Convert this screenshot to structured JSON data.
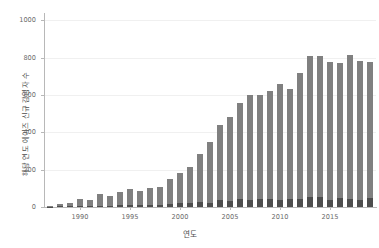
{
  "chart_data": {
    "type": "bar",
    "stacked": true,
    "title": "",
    "subtitle": "",
    "xlabel": "연도",
    "ylabel": "해당 연도 에이즈 신규 감염자 수",
    "xlim": [
      1986.4,
      2019.6
    ],
    "ylim": [
      0,
      1040
    ],
    "yticks": [
      0,
      200,
      400,
      600,
      800,
      1000
    ],
    "ytick_labels": [
      "0",
      "200",
      "400",
      "600",
      "800",
      "1000"
    ],
    "xticks": [
      1990,
      1995,
      2000,
      2005,
      2010,
      2015
    ],
    "xtick_labels": [
      "1990",
      "1995",
      "2000",
      "2005",
      "2010",
      "2015"
    ],
    "grid": true,
    "grid_axis": "y",
    "legend": null,
    "colors": {
      "segment_lower": "#4d4d4d",
      "segment_upper": "#808080",
      "axis": "#b8b8b8",
      "grid": "#f0f0f0",
      "text": "#4d4d4d",
      "tick_text": "#6b6b6b",
      "background": "#ffffff"
    },
    "categories": [
      "1987",
      "1988",
      "1989",
      "1990",
      "1991",
      "1992",
      "1993",
      "1994",
      "1995",
      "1996",
      "1997",
      "1998",
      "1999",
      "2000",
      "2001",
      "2002",
      "2003",
      "2004",
      "2005",
      "2006",
      "2007",
      "2008",
      "2009",
      "2010",
      "2011",
      "2012",
      "2013",
      "2014",
      "2015",
      "2016",
      "2017",
      "2018",
      "2019"
    ],
    "series": [
      {
        "name": "segment-lower",
        "values": [
          2,
          3,
          4,
          6,
          5,
          8,
          7,
          9,
          12,
          10,
          11,
          13,
          15,
          22,
          24,
          26,
          24,
          40,
          30,
          44,
          36,
          44,
          44,
          38,
          42,
          42,
          54,
          52,
          38,
          48,
          44,
          40,
          46
        ]
      },
      {
        "name": "segment-upper",
        "values": [
          1,
          13,
          18,
          35,
          30,
          63,
          50,
          70,
          85,
          78,
          92,
          95,
          134,
          158,
          190,
          258,
          325,
          400,
          452,
          514,
          566,
          558,
          578,
          622,
          592,
          678,
          758,
          760,
          739,
          722,
          769,
          744,
          731
        ]
      }
    ],
    "totals": [
      3,
      16,
      22,
      41,
      35,
      71,
      57,
      79,
      97,
      88,
      103,
      108,
      149,
      180,
      214,
      284,
      349,
      440,
      482,
      558,
      602,
      602,
      622,
      660,
      634,
      720,
      812,
      812,
      777,
      770,
      813,
      784,
      777
    ]
  }
}
